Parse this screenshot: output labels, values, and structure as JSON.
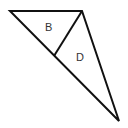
{
  "diagram": {
    "type": "geometry-triangle",
    "outer_triangle": {
      "vertices": [
        [
          10,
          11
        ],
        [
          82,
          11
        ],
        [
          119,
          121
        ]
      ]
    },
    "segment": {
      "from": [
        82,
        11
      ],
      "to": [
        54,
        56
      ]
    },
    "labels": [
      {
        "text": "B",
        "x": 49,
        "y": 31
      },
      {
        "text": "D",
        "x": 80,
        "y": 61
      }
    ],
    "stroke_color": "#111111",
    "label_color": "#333333"
  }
}
